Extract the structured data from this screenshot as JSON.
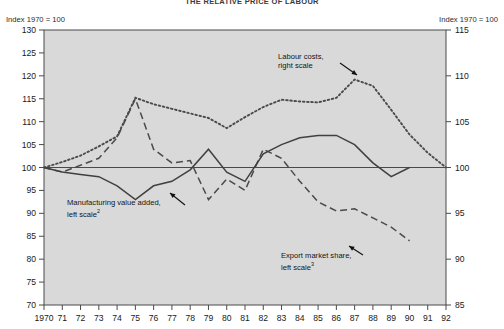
{
  "figure": {
    "title": "THE RELATIVE PRICE OF LABOUR",
    "left_axis_unit": "Index 1970 = 100",
    "right_axis_unit": "Index 1970 = 100"
  },
  "annotations": {
    "labour_costs": {
      "line1": "Labour costs,",
      "line2": "right scale"
    },
    "manufacturing": {
      "line1": "Manufacturing value added,",
      "line2": "left scale",
      "footnote": "2"
    },
    "export_share": {
      "line1": "Export market share,",
      "line2": "left scale",
      "footnote": "3"
    }
  },
  "colors": {
    "plot_background": "#d9d9d9",
    "frame": "#4a4a4a",
    "solid_series": "#404040",
    "dashed_series": "#4a4a4a",
    "dotted_series": "#4a4a4a",
    "text": "#1a1a1a"
  },
  "chart_data": {
    "type": "line",
    "title": "THE RELATIVE PRICE OF LABOUR",
    "xlabel": "",
    "ylabel": "Index 1970 = 100",
    "grid": false,
    "legend": "annotations-inline",
    "x": [
      1970,
      1971,
      1972,
      1973,
      1974,
      1975,
      1976,
      1977,
      1978,
      1979,
      1980,
      1981,
      1982,
      1983,
      1984,
      1985,
      1986,
      1987,
      1988,
      1989,
      1990,
      1991,
      1992
    ],
    "xtick_labels": [
      "1970",
      "71",
      "72",
      "73",
      "74",
      "75",
      "76",
      "77",
      "78",
      "79",
      "80",
      "81",
      "82",
      "83",
      "84",
      "85",
      "86",
      "87",
      "88",
      "89",
      "90",
      "91",
      "92"
    ],
    "left_axis": {
      "label": "Index 1970 = 100",
      "ylim": [
        70,
        130
      ],
      "ticks": [
        70,
        75,
        80,
        85,
        90,
        95,
        100,
        105,
        110,
        115,
        120,
        125,
        130
      ]
    },
    "right_axis": {
      "label": "Index 1970 = 100",
      "ylim": [
        85,
        115
      ],
      "ticks": [
        85,
        90,
        95,
        100,
        105,
        110,
        115
      ]
    },
    "series": [
      {
        "name": "Labour costs, right scale",
        "axis": "right",
        "style": "dotted",
        "values": [
          100.0,
          100.6,
          101.3,
          102.3,
          103.4,
          107.6,
          106.9,
          106.4,
          105.9,
          105.4,
          104.3,
          105.5,
          106.6,
          107.4,
          107.2,
          107.1,
          107.6,
          109.6,
          108.9,
          106.3,
          103.6,
          101.6,
          100.0
        ]
      },
      {
        "name": "Export market share, left scale",
        "axis": "left",
        "style": "dashed",
        "values": [
          100.0,
          99.0,
          100.5,
          102.0,
          106.5,
          115.0,
          104.0,
          101.0,
          101.5,
          93.0,
          97.5,
          95.0,
          104.0,
          102.0,
          97.0,
          92.5,
          90.5,
          91.0,
          89.0,
          87.0,
          84.0,
          null,
          null
        ]
      },
      {
        "name": "Manufacturing value added, left scale",
        "axis": "left",
        "style": "solid",
        "values": [
          100.0,
          99.0,
          98.5,
          98.0,
          96.0,
          93.0,
          96.0,
          97.0,
          99.5,
          104.0,
          99.0,
          97.0,
          103.0,
          105.0,
          106.5,
          107.0,
          107.0,
          105.0,
          101.0,
          98.0,
          100.0,
          null,
          null
        ]
      }
    ]
  }
}
